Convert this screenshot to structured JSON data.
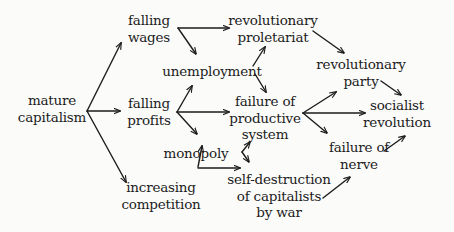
{
  "diagram": {
    "type": "causal-flow",
    "colors": {
      "background": "#fbfbfa",
      "ink": "#1c1c1c"
    },
    "nodes": {
      "mature_capitalism": {
        "lines": [
          "mature",
          "capitalism"
        ]
      },
      "falling_wages": {
        "lines": [
          "falling",
          "wages"
        ]
      },
      "falling_profits": {
        "lines": [
          "falling",
          "profits"
        ]
      },
      "increasing_competition": {
        "lines": [
          "increasing",
          "competition"
        ]
      },
      "unemployment": {
        "lines": [
          "unemployment"
        ]
      },
      "monopoly": {
        "lines": [
          "monopoly"
        ]
      },
      "revolutionary_proletariat": {
        "lines": [
          "revolutionary",
          "proletariat"
        ]
      },
      "failure_productive_system": {
        "lines": [
          "failure of",
          "productive",
          "system"
        ]
      },
      "self_destruction": {
        "lines": [
          "self-destruction",
          "of capitalists",
          "by war"
        ]
      },
      "revolutionary_party": {
        "lines": [
          "revolutionary",
          "party"
        ]
      },
      "failure_of_nerve": {
        "lines": [
          "failure of",
          "nerve"
        ]
      },
      "socialist_revolution": {
        "lines": [
          "socialist",
          "revolution"
        ]
      }
    },
    "edges": [
      {
        "from": "mature capitalism",
        "to": "falling wages"
      },
      {
        "from": "mature capitalism",
        "to": "falling profits"
      },
      {
        "from": "mature capitalism",
        "to": "increasing competition"
      },
      {
        "from": "falling wages",
        "to": "revolutionary proletariat"
      },
      {
        "from": "falling wages",
        "to": "unemployment"
      },
      {
        "from": "falling profits",
        "to": "unemployment"
      },
      {
        "from": "falling profits",
        "to": "failure of productive system"
      },
      {
        "from": "falling profits",
        "to": "monopoly"
      },
      {
        "from": "unemployment",
        "to": "revolutionary proletariat"
      },
      {
        "from": "unemployment",
        "to": "failure of productive system"
      },
      {
        "from": "increasing competition",
        "to": "monopoly"
      },
      {
        "from": "increasing competition",
        "to": "self-destruction of capitalists by war"
      },
      {
        "from": "self-destruction of capitalists by war",
        "to": "failure of productive system"
      },
      {
        "from": "failure of productive system",
        "to": "self-destruction of capitalists by war"
      },
      {
        "from": "revolutionary proletariat",
        "to": "revolutionary party"
      },
      {
        "from": "failure of productive system",
        "to": "revolutionary party"
      },
      {
        "from": "failure of productive system",
        "to": "socialist revolution"
      },
      {
        "from": "failure of productive system",
        "to": "failure of nerve"
      },
      {
        "from": "self-destruction of capitalists by war",
        "to": "failure of nerve"
      },
      {
        "from": "revolutionary party",
        "to": "socialist revolution"
      },
      {
        "from": "failure of nerve",
        "to": "socialist revolution"
      }
    ]
  }
}
